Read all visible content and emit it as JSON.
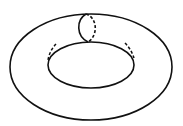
{
  "diagram": {
    "stroke_color": "#111111",
    "background": "#ffffff",
    "outer_ellipse": {
      "cx": 91,
      "cy": 67,
      "rx": 81,
      "ry": 53
    },
    "inner_ellipse": {
      "cx": 91,
      "cy": 65,
      "rx": 43,
      "ry": 23
    },
    "meridian_loop": {
      "front": "solid",
      "back": "dashed"
    },
    "inner_fold_marks": "dashed"
  }
}
